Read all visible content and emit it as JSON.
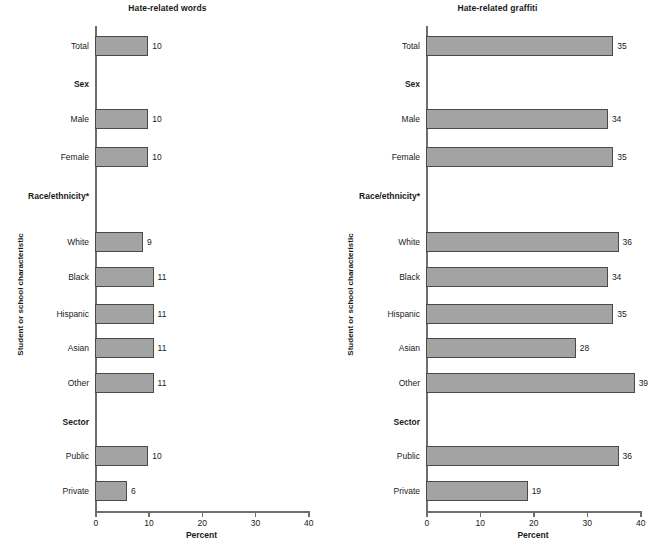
{
  "figure": {
    "yaxis_label": "Student or school characteristic",
    "xaxis_label": "Percent",
    "bar_color": "#a3a3a3",
    "bar_border_color": "#4a4a4a",
    "axis_color": "#6e6e6e"
  },
  "chart_data": [
    {
      "type": "bar",
      "title": "Hate-related words",
      "orientation": "horizontal",
      "xlabel": "Percent",
      "ylabel": "Student or school characteristic",
      "xlim": [
        0,
        40
      ],
      "xticks": [
        0,
        10,
        20,
        30,
        40
      ],
      "xtick_labels": [
        "0",
        "10",
        "20",
        "30",
        "40"
      ],
      "grid": false,
      "legend": "none",
      "rows": [
        {
          "label": "Total",
          "group": false,
          "value": 10,
          "value_label": "10"
        },
        {
          "label": "Sex",
          "group": true,
          "value": null,
          "value_label": ""
        },
        {
          "label": "Male",
          "group": false,
          "value": 10,
          "value_label": "10"
        },
        {
          "label": "Female",
          "group": false,
          "value": 10,
          "value_label": "10"
        },
        {
          "label": "Race/ethnicity*",
          "group": true,
          "value": null,
          "value_label": ""
        },
        {
          "label": "White",
          "group": false,
          "value": 9,
          "value_label": "9"
        },
        {
          "label": "Black",
          "group": false,
          "value": 11,
          "value_label": "11"
        },
        {
          "label": "Hispanic",
          "group": false,
          "value": 11,
          "value_label": "11"
        },
        {
          "label": "Asian",
          "group": false,
          "value": 11,
          "value_label": "11"
        },
        {
          "label": "Other",
          "group": false,
          "value": 11,
          "value_label": "11"
        },
        {
          "label": "Sector",
          "group": true,
          "value": null,
          "value_label": ""
        },
        {
          "label": "Public",
          "group": false,
          "value": 10,
          "value_label": "10"
        },
        {
          "label": "Private",
          "group": false,
          "value": 6,
          "value_label": "6"
        }
      ]
    },
    {
      "type": "bar",
      "title": "Hate-related graffiti",
      "orientation": "horizontal",
      "xlabel": "Percent",
      "ylabel": "Student or school characteristic",
      "xlim": [
        0,
        40
      ],
      "xticks": [
        0,
        10,
        20,
        30,
        40
      ],
      "xtick_labels": [
        "0",
        "10",
        "20",
        "30",
        "40"
      ],
      "grid": false,
      "legend": "none",
      "rows": [
        {
          "label": "Total",
          "group": false,
          "value": 35,
          "value_label": "35"
        },
        {
          "label": "Sex",
          "group": true,
          "value": null,
          "value_label": ""
        },
        {
          "label": "Male",
          "group": false,
          "value": 34,
          "value_label": "34"
        },
        {
          "label": "Female",
          "group": false,
          "value": 35,
          "value_label": "35"
        },
        {
          "label": "Race/ethnicity*",
          "group": true,
          "value": null,
          "value_label": ""
        },
        {
          "label": "White",
          "group": false,
          "value": 36,
          "value_label": "36"
        },
        {
          "label": "Black",
          "group": false,
          "value": 34,
          "value_label": "34"
        },
        {
          "label": "Hispanic",
          "group": false,
          "value": 35,
          "value_label": "35"
        },
        {
          "label": "Asian",
          "group": false,
          "value": 28,
          "value_label": "28"
        },
        {
          "label": "Other",
          "group": false,
          "value": 39,
          "value_label": "39"
        },
        {
          "label": "Sector",
          "group": true,
          "value": null,
          "value_label": ""
        },
        {
          "label": "Public",
          "group": false,
          "value": 36,
          "value_label": "36"
        },
        {
          "label": "Private",
          "group": false,
          "value": 19,
          "value_label": "19"
        }
      ]
    }
  ]
}
